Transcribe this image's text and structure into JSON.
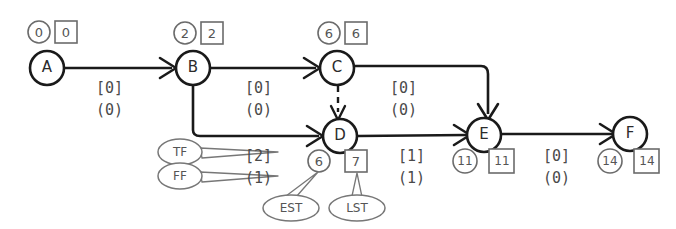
{
  "diagram": {
    "type": "project-network-diagram",
    "colors": {
      "node_stroke": "#1a1a1a",
      "edge_stroke": "#1a1a1a",
      "badge_stroke": "#6b6b6b",
      "text": "#2b2b2b",
      "label_text": "#4a4a4a",
      "background": "#ffffff"
    },
    "nodes": [
      {
        "id": "A",
        "label": "A",
        "est": "0",
        "lst": "0",
        "badge_side": "above",
        "x": 47,
        "y": 68
      },
      {
        "id": "B",
        "label": "B",
        "est": "2",
        "lst": "2",
        "badge_side": "above",
        "x": 193,
        "y": 68
      },
      {
        "id": "C",
        "label": "C",
        "est": "6",
        "lst": "6",
        "badge_side": "above",
        "x": 337,
        "y": 68
      },
      {
        "id": "D",
        "label": "D",
        "est": "6",
        "lst": "7",
        "badge_side": "below",
        "x": 340,
        "y": 136
      },
      {
        "id": "E",
        "label": "E",
        "est": "11",
        "lst": "11",
        "badge_side": "below",
        "x": 484,
        "y": 135
      },
      {
        "id": "F",
        "label": "F",
        "est": "14",
        "lst": "14",
        "badge_side": "below",
        "x": 630,
        "y": 134
      }
    ],
    "edges": [
      {
        "id": "A-B",
        "from": "A",
        "to": "B",
        "tf": "[0]",
        "ff": "(0)",
        "style": "solid",
        "label_x": 96,
        "label_y": 78
      },
      {
        "id": "B-C",
        "from": "B",
        "to": "C",
        "tf": "[0]",
        "ff": "(0)",
        "style": "solid",
        "label_x": 245,
        "label_y": 78
      },
      {
        "id": "C-E",
        "from": "C",
        "to": "E",
        "tf": "[0]",
        "ff": "(0)",
        "style": "solid",
        "label_x": 390,
        "label_y": 78
      },
      {
        "id": "B-D",
        "from": "B",
        "to": "D",
        "tf": "[2]",
        "ff": "(1)",
        "style": "solid",
        "label_x": 245,
        "label_y": 146
      },
      {
        "id": "D-E",
        "from": "D",
        "to": "E",
        "tf": "[1]",
        "ff": "(1)",
        "style": "solid",
        "label_x": 400,
        "label_y": 146
      },
      {
        "id": "E-F",
        "from": "E",
        "to": "F",
        "tf": "[0]",
        "ff": "(0)",
        "style": "solid",
        "label_x": 545,
        "label_y": 146
      },
      {
        "id": "C-D",
        "from": "C",
        "to": "D",
        "tf": "",
        "ff": "",
        "style": "dashed",
        "label_x": 0,
        "label_y": 0
      }
    ],
    "callouts": [
      {
        "id": "tf",
        "label": "TF",
        "points_to": "[2]",
        "cx": 180,
        "cy": 152
      },
      {
        "id": "ff",
        "label": "FF",
        "points_to": "(1)",
        "cx": 180,
        "cy": 176
      },
      {
        "id": "est",
        "label": "EST",
        "points_to": "6",
        "cx": 291,
        "cy": 208
      },
      {
        "id": "lst",
        "label": "LST",
        "points_to": "7",
        "cx": 357,
        "cy": 208
      }
    ],
    "legend": {
      "tf_meaning": "TF",
      "ff_meaning": "FF",
      "est_meaning": "EST",
      "lst_meaning": "LST",
      "circle_badge_meaning": "EST",
      "square_badge_meaning": "LST"
    }
  }
}
